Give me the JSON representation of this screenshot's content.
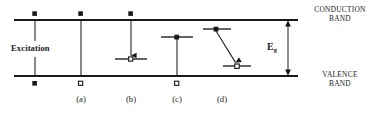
{
  "figure": {
    "type": "semiconductor-band-diagram",
    "width": 380,
    "height": 113,
    "background_color": "#ffffff",
    "line_color": "#1a1a1a"
  },
  "bands": {
    "conduction": {
      "label_line1": "CONDUCTION",
      "label_line2": "BAND",
      "y": 20,
      "x_start": 14,
      "x_end": 298
    },
    "valence": {
      "label_line1": "VALENCE",
      "label_line2": "BAND",
      "y": 76,
      "x_start": 14,
      "x_end": 298
    }
  },
  "gap": {
    "label": "E",
    "subscript": "g",
    "arrow_x": 288,
    "arrow_top": 20,
    "arrow_bottom": 76,
    "style": "double-headed-vertical-arrow"
  },
  "excitation": {
    "label": "Excitation",
    "x": 35,
    "top_y": 20,
    "bottom_y": 76,
    "carriers": {
      "electron_top": "filled",
      "hole_bottom": "filled"
    }
  },
  "transitions": [
    {
      "id": "a",
      "label": "(a)",
      "x": 81,
      "kind": "band-to-band",
      "from_y": 20,
      "to_y": 76,
      "top_marker": "filled",
      "bottom_marker": "hollow",
      "has_arrowhead": false,
      "level_line": false
    },
    {
      "id": "b",
      "label": "(b)",
      "x": 131,
      "kind": "conduction-to-trap",
      "from_y": 20,
      "to_y": 59,
      "top_marker": "filled",
      "bottom_marker": "hollow",
      "has_arrowhead": true,
      "level_line": true,
      "level_y": 59,
      "level_half_width": 16
    },
    {
      "id": "c",
      "label": "(c)",
      "x": 177,
      "kind": "trap-to-valence",
      "from_y": 37,
      "to_y": 76,
      "top_marker": "filled",
      "bottom_marker": "hollow",
      "has_arrowhead": false,
      "level_line": true,
      "level_y": 37,
      "level_half_width": 16
    },
    {
      "id": "d",
      "label": "(d)",
      "x": 222,
      "kind": "trap-to-trap-diagonal",
      "from_x": 216,
      "from_y": 29,
      "to_x": 237,
      "to_y": 66,
      "top_marker": "filled",
      "bottom_marker": "hollow",
      "has_arrowhead": true,
      "level_line": true,
      "upper_level_y": 29,
      "lower_level_y": 66,
      "level_half_width": 15
    }
  ],
  "markers": {
    "filled_note": "solid black square/dot = electron",
    "hollow_note": "open square/dot = hole"
  }
}
